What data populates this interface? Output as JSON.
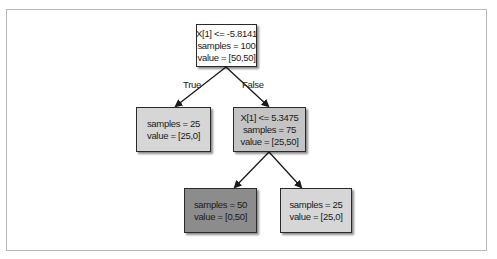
{
  "diagram": {
    "type": "decision-tree",
    "nodes": {
      "root": {
        "condition": "X[1] <= -5.8141",
        "samples": "samples = 100",
        "value": "value = [50,50]",
        "fill": "#ffffff"
      },
      "left": {
        "samples": "samples = 25",
        "value": "value = [25,0]",
        "fill": "#d6d6d6"
      },
      "right": {
        "condition": "X[1] <= 5.3475",
        "samples": "samples = 75",
        "value": "value = [25,50]",
        "fill": "#c4c4c4"
      },
      "right_left": {
        "samples": "samples = 50",
        "value": "value = [0,50]",
        "fill": "#8c8c8c"
      },
      "right_right": {
        "samples": "samples = 25",
        "value": "value = [25,0]",
        "fill": "#d6d6d6"
      }
    },
    "edge_labels": {
      "true": "True",
      "false": "False"
    },
    "colors": {
      "border": "#2a2a2a",
      "frame": "#b8b8b8",
      "edge": "#1a1a1a"
    }
  }
}
